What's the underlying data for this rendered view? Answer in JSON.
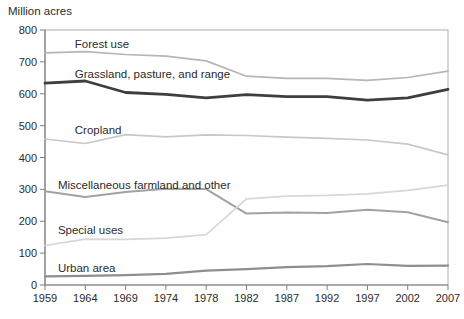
{
  "title": "Million acres",
  "colors": {
    "text": "#2b2b2b",
    "axis": "#7f7f7f",
    "frame": "#aeaeae",
    "background": "#ffffff"
  },
  "chart_data": {
    "type": "line",
    "title": "Million acres",
    "xlabel": "",
    "ylabel": "Million acres",
    "ylim": [
      0,
      800
    ],
    "yticks": [
      0,
      100,
      200,
      300,
      400,
      500,
      600,
      700,
      800
    ],
    "grid": false,
    "legend": "inline-labels",
    "x_categories": [
      "1959",
      "1964",
      "1969",
      "1974",
      "1978",
      "1982",
      "1987",
      "1992",
      "1997",
      "2002",
      "2007"
    ],
    "series": [
      {
        "name": "Forest use",
        "values": [
          728,
          732,
          723,
          718,
          703,
          655,
          648,
          648,
          642,
          651,
          671
        ],
        "color": "#b6b6b6",
        "width": 1.7,
        "label_pos": [
          0.74,
          745
        ]
      },
      {
        "name": "Grassland, pasture, and range",
        "values": [
          633,
          640,
          604,
          598,
          587,
          597,
          591,
          591,
          580,
          587,
          614
        ],
        "color": "#3e3e3e",
        "width": 2.8,
        "label_pos": [
          0.74,
          650
        ]
      },
      {
        "name": "Cropland",
        "values": [
          458,
          444,
          472,
          465,
          471,
          469,
          464,
          460,
          455,
          442,
          408
        ],
        "color": "#c8c8c8",
        "width": 1.7,
        "label_pos": [
          0.74,
          475
        ]
      },
      {
        "name": "Miscellaneous farmland and other",
        "values": [
          294,
          276,
          292,
          302,
          301,
          224,
          227,
          226,
          236,
          228,
          197
        ],
        "color": "#a2a2a2",
        "width": 2.0,
        "label_pos": [
          0.32,
          300
        ]
      },
      {
        "name": "Special uses",
        "values": [
          124,
          144,
          143,
          147,
          158,
          270,
          279,
          281,
          286,
          297,
          313
        ],
        "color": "#d7d7d7",
        "width": 1.7,
        "label_pos": [
          0.32,
          160
        ]
      },
      {
        "name": "Urban area",
        "values": [
          27,
          29,
          31,
          35,
          45,
          50,
          56,
          59,
          66,
          60,
          61
        ],
        "color": "#8e8e8e",
        "width": 2.2,
        "label_pos": [
          0.32,
          42
        ]
      }
    ]
  }
}
